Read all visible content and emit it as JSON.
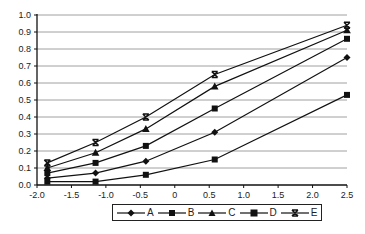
{
  "chart_data": {
    "type": "line",
    "title": "",
    "xlabel": "",
    "ylabel": "",
    "xlim": [
      -2.0,
      2.5
    ],
    "ylim": [
      0.0,
      1.0
    ],
    "grid": {
      "horizontal": true,
      "vertical": false
    },
    "legend_position": "bottom",
    "x_ticks": [
      "-2.0",
      "-1.5",
      "-1.0",
      "-0.5",
      "0",
      "0.5",
      "1.0",
      "1.5",
      "2.0",
      "2.5"
    ],
    "y_ticks": [
      "0.0",
      "0.1",
      "0.2",
      "0.3",
      "0.4",
      "0.5",
      "0.6",
      "0.7",
      "0.8",
      "0.9",
      "1.0"
    ],
    "x": [
      -1.85,
      -1.15,
      -0.42,
      0.58,
      2.5
    ],
    "series": [
      {
        "name": "A",
        "marker": "diamond",
        "values": [
          0.04,
          0.07,
          0.14,
          0.31,
          0.75
        ]
      },
      {
        "name": "B",
        "marker": "square",
        "values": [
          0.02,
          0.02,
          0.06,
          0.15,
          0.53
        ]
      },
      {
        "name": "C",
        "marker": "triangle",
        "values": [
          0.1,
          0.19,
          0.33,
          0.58,
          0.91
        ]
      },
      {
        "name": "D",
        "marker": "square",
        "values": [
          0.07,
          0.13,
          0.23,
          0.45,
          0.86
        ]
      },
      {
        "name": "E",
        "marker": "asterisk",
        "values": [
          0.13,
          0.25,
          0.4,
          0.65,
          0.94
        ]
      }
    ]
  },
  "legend": {
    "items": [
      {
        "label": "A",
        "marker": "diamond-icon"
      },
      {
        "label": "B",
        "marker": "square-icon"
      },
      {
        "label": "C",
        "marker": "triangle-icon"
      },
      {
        "label": "D",
        "marker": "square-icon"
      },
      {
        "label": "E",
        "marker": "asterisk-icon"
      }
    ]
  },
  "style": {
    "line_color": "#111111",
    "grid_color": "#888888",
    "axis_color": "#111111"
  }
}
